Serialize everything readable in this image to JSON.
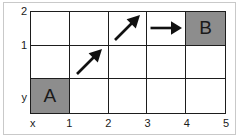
{
  "figure": {
    "type": "grid-path-diagram",
    "background_color": "#ffffff",
    "frame_color": "#c9c9c9",
    "grid_line_color": "#1d1d1d",
    "filled_cell_color": "#8d8d8d",
    "columns": 5,
    "rows": 3
  },
  "axes": {
    "x_axis_name": "x",
    "y_axis_name": "y",
    "x_ticks": [
      "1",
      "2",
      "3",
      "4",
      "5"
    ],
    "y_ticks": [
      "1",
      "2"
    ]
  },
  "cells": [
    {
      "id": "cell-r2-c0",
      "col": 0,
      "row": 2,
      "label": "",
      "filled": false,
      "arrow": "none"
    },
    {
      "id": "cell-r2-c1",
      "col": 1,
      "row": 2,
      "label": "",
      "filled": false,
      "arrow": "none"
    },
    {
      "id": "cell-r2-c2",
      "col": 2,
      "row": 2,
      "label": "",
      "filled": false,
      "arrow": "diagonal-up-right"
    },
    {
      "id": "cell-r2-c3",
      "col": 3,
      "row": 2,
      "label": "",
      "filled": false,
      "arrow": "right"
    },
    {
      "id": "cell-r2-c4",
      "col": 4,
      "row": 2,
      "label": "",
      "filled": false,
      "arrow": "right"
    },
    {
      "id": "cell-r2-c5",
      "col": 5,
      "row": 2,
      "label": "B",
      "filled": true,
      "arrow": "none"
    },
    {
      "id": "cell-r1-c0",
      "col": 0,
      "row": 1,
      "label": "",
      "filled": false,
      "arrow": "none"
    },
    {
      "id": "cell-r1-c1",
      "col": 1,
      "row": 1,
      "label": "",
      "filled": false,
      "arrow": "diagonal-up-right"
    },
    {
      "id": "cell-r1-c2",
      "col": 2,
      "row": 1,
      "label": "",
      "filled": false,
      "arrow": "none"
    },
    {
      "id": "cell-r1-c3",
      "col": 3,
      "row": 1,
      "label": "",
      "filled": false,
      "arrow": "none"
    },
    {
      "id": "cell-r1-c4",
      "col": 4,
      "row": 1,
      "label": "",
      "filled": false,
      "arrow": "none"
    },
    {
      "id": "cell-r0-c0",
      "col": 0,
      "row": 0,
      "label": "A",
      "filled": true,
      "arrow": "none"
    },
    {
      "id": "cell-r0-c1",
      "col": 1,
      "row": 0,
      "label": "",
      "filled": false,
      "arrow": "none"
    },
    {
      "id": "cell-r0-c2",
      "col": 2,
      "row": 0,
      "label": "",
      "filled": false,
      "arrow": "none"
    },
    {
      "id": "cell-r0-c3",
      "col": 3,
      "row": 0,
      "label": "",
      "filled": false,
      "arrow": "none"
    },
    {
      "id": "cell-r0-c4",
      "col": 4,
      "row": 0,
      "label": "",
      "filled": false,
      "arrow": "none"
    }
  ],
  "grid": {
    "row_top": [
      {
        "label": "",
        "filled": false,
        "arrow": "none"
      },
      {
        "label": "",
        "filled": false,
        "arrow": "none"
      },
      {
        "label": "",
        "filled": false,
        "arrow": "diagonal-up-right"
      },
      {
        "label": "",
        "filled": false,
        "arrow": "right"
      },
      {
        "label": "B",
        "filled": true,
        "arrow": "none"
      }
    ],
    "row_middle": [
      {
        "label": "",
        "filled": false,
        "arrow": "none"
      },
      {
        "label": "",
        "filled": false,
        "arrow": "diagonal-up-right"
      },
      {
        "label": "",
        "filled": false,
        "arrow": "none"
      },
      {
        "label": "",
        "filled": false,
        "arrow": "none"
      },
      {
        "label": "",
        "filled": false,
        "arrow": "none"
      }
    ],
    "row_bottom": [
      {
        "label": "A",
        "filled": true,
        "arrow": "none"
      },
      {
        "label": "",
        "filled": false,
        "arrow": "none"
      },
      {
        "label": "",
        "filled": false,
        "arrow": "none"
      },
      {
        "label": "",
        "filled": false,
        "arrow": "none"
      },
      {
        "label": "",
        "filled": false,
        "arrow": "none"
      }
    ]
  },
  "path": {
    "start_label": "A",
    "end_label": "B",
    "steps": [
      "diagonal-up-right",
      "diagonal-up-right",
      "right",
      "right"
    ]
  }
}
